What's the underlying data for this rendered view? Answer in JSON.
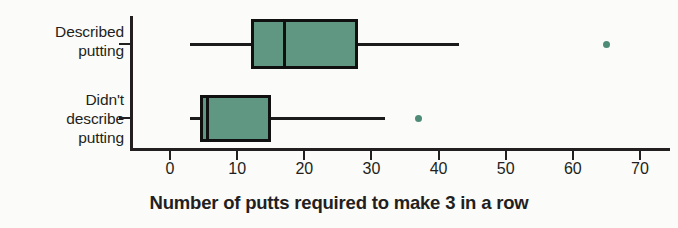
{
  "chart_data": {
    "type": "boxplot",
    "title": "",
    "xlabel": "Number of putts required to make 3 in a row",
    "ylabel": "",
    "xlim": [
      0,
      70
    ],
    "xticks": [
      0,
      10,
      20,
      30,
      40,
      50,
      60,
      70
    ],
    "xtick_labels": [
      "0",
      "10",
      "20",
      "30",
      "40",
      "50",
      "60",
      "70"
    ],
    "grid": false,
    "legend": "none",
    "orientation": "horizontal",
    "categories": [
      "Described\nputting",
      "Didn't\ndescribe\nputting"
    ],
    "boxes": [
      {
        "name": "Described putting",
        "whisker_low": 3,
        "q1": 12,
        "median": 17,
        "q3": 28,
        "whisker_high": 43,
        "outliers": [
          65
        ]
      },
      {
        "name": "Didn't describe putting",
        "whisker_low": 3,
        "q1": 4.5,
        "median": 5.5,
        "q3": 15,
        "whisker_high": 32,
        "outliers": [
          37
        ]
      }
    ],
    "colors": {
      "box_fill": "#5f9782",
      "box_edge": "#101010",
      "outlier": "#4f8c78",
      "axis": "#231f20",
      "text": "#231f20",
      "background": "#fbfbf9"
    }
  }
}
